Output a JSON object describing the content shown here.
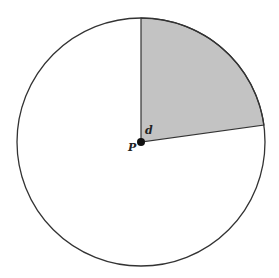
{
  "diagram": {
    "type": "circle-sector",
    "center": {
      "x": 141,
      "y": 142
    },
    "radius": 124,
    "sector": {
      "start_point": {
        "x": 141,
        "y": 18
      },
      "end_point": {
        "x": 264,
        "y": 125
      },
      "fill": "#c3c3c3"
    },
    "stroke_color": "#333333",
    "labels": {
      "center_point": "P",
      "angle": "d"
    }
  }
}
